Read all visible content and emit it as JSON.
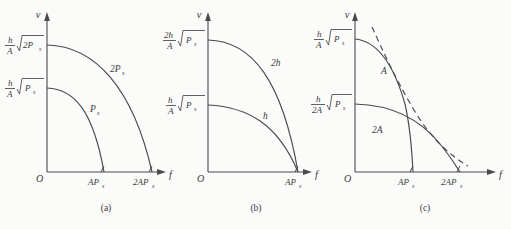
{
  "figure": {
    "title": "",
    "background_color": "#fbfbfa",
    "line_color": "#4a4a4a",
    "text_color": "#3a3a3a"
  },
  "panels": [
    {
      "id": "panel-a",
      "caption": "(a)",
      "axes": {
        "y_label": "v",
        "x_label": "f",
        "origin_label": "O"
      },
      "y_ticks": [
        {
          "label_html": "h/A √(2Pₛ)",
          "num": "h",
          "den": "A",
          "radicand": "2P",
          "sub": "s"
        },
        {
          "label_html": "h/A √(Pₛ)",
          "num": "h",
          "den": "A",
          "radicand": "P",
          "sub": "s"
        }
      ],
      "x_ticks": [
        {
          "label": "AP",
          "sub": "s"
        },
        {
          "label": "2AP",
          "sub": "s"
        }
      ],
      "curves": [
        {
          "name": "outer-curve",
          "label": "2P",
          "label_sub": "s"
        },
        {
          "name": "inner-curve",
          "label": "P",
          "label_sub": "s"
        }
      ]
    },
    {
      "id": "panel-b",
      "caption": "(b)",
      "axes": {
        "y_label": "v",
        "x_label": "f",
        "origin_label": "O"
      },
      "y_ticks": [
        {
          "label_html": "2h/A √(Pₛ)",
          "num": "2h",
          "den": "A",
          "radicand": "P",
          "sub": "s"
        },
        {
          "label_html": "h/A √(Pₛ)",
          "num": "h",
          "den": "A",
          "radicand": "P",
          "sub": "s"
        }
      ],
      "x_ticks": [
        {
          "label": "AP",
          "sub": "s"
        }
      ],
      "curves": [
        {
          "name": "outer-curve",
          "label": "2h",
          "label_sub": ""
        },
        {
          "name": "inner-curve",
          "label": "h",
          "label_sub": ""
        }
      ]
    },
    {
      "id": "panel-c",
      "caption": "(c)",
      "axes": {
        "y_label": "v",
        "x_label": "f",
        "origin_label": "O"
      },
      "y_ticks": [
        {
          "label_html": "h/A √(Pₛ)",
          "num": "h",
          "den": "A",
          "radicand": "P",
          "sub": "s"
        },
        {
          "label_html": "h/2A √(Pₛ)",
          "num": "h",
          "den": "2A",
          "radicand": "P",
          "sub": "s"
        }
      ],
      "x_ticks": [
        {
          "label": "AP",
          "sub": "s"
        },
        {
          "label": "2AP",
          "sub": "s"
        }
      ],
      "curves": [
        {
          "name": "curve-A",
          "label": "A",
          "label_sub": "",
          "style": "solid"
        },
        {
          "name": "curve-2A",
          "label": "2A",
          "label_sub": "",
          "style": "solid"
        },
        {
          "name": "envelope-curve",
          "label": "",
          "label_sub": "",
          "style": "dashed"
        }
      ]
    }
  ]
}
